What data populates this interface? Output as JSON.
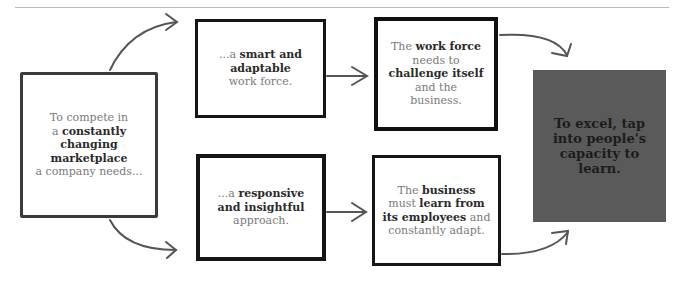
{
  "diagram": {
    "colors": {
      "dark_box": "#5a5a5a",
      "stroke": "#1a1a1a",
      "arrow": "#555555",
      "light_text": "#7a7a7a",
      "bold_text": "#2a2a2a"
    },
    "start": {
      "l1": "To compete in",
      "l2a": "a ",
      "l2b": "constantly",
      "l3": "changing",
      "l4": "marketplace",
      "l5": "a company needs..."
    },
    "mid_top": {
      "a": "...a ",
      "b": "smart and",
      "c": "adaptable",
      "d": "work force."
    },
    "mid_bottom": {
      "a": "...a ",
      "b": "responsive",
      "c": "and insightful",
      "d": "approach."
    },
    "right_top": {
      "a": "The ",
      "b": "work force",
      "c": "needs to",
      "d": "challenge itself",
      "e": "and the",
      "f": "business."
    },
    "right_bottom": {
      "a": "The ",
      "b": "business",
      "c": "must ",
      "d": "learn from",
      "e": "its employees",
      "f": " and",
      "g": "constantly adapt."
    },
    "conclusion": {
      "l1": "To excel, tap",
      "l2": "into people's",
      "l3": "capacity to",
      "l4": "learn."
    }
  }
}
